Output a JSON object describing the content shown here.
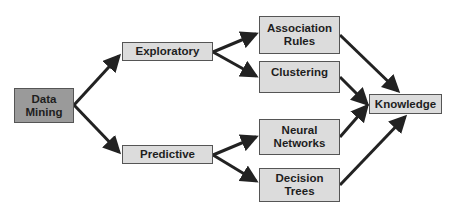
{
  "diagram": {
    "type": "flow",
    "nodes": [
      {
        "id": "data-mining",
        "label": "Data\nMining"
      },
      {
        "id": "exploratory",
        "label": "Exploratory"
      },
      {
        "id": "predictive",
        "label": "Predictive"
      },
      {
        "id": "association-rules",
        "label": "Association\nRules"
      },
      {
        "id": "clustering",
        "label": "Clustering"
      },
      {
        "id": "neural-networks",
        "label": "Neural\nNetworks"
      },
      {
        "id": "decision-trees",
        "label": "Decision\nTrees"
      },
      {
        "id": "knowledge",
        "label": "Knowledge"
      }
    ],
    "edges": [
      {
        "from": "data-mining",
        "to": "exploratory"
      },
      {
        "from": "data-mining",
        "to": "predictive"
      },
      {
        "from": "exploratory",
        "to": "association-rules"
      },
      {
        "from": "exploratory",
        "to": "clustering"
      },
      {
        "from": "predictive",
        "to": "neural-networks"
      },
      {
        "from": "predictive",
        "to": "decision-trees"
      },
      {
        "from": "association-rules",
        "to": "knowledge"
      },
      {
        "from": "clustering",
        "to": "knowledge"
      },
      {
        "from": "neural-networks",
        "to": "knowledge"
      },
      {
        "from": "decision-trees",
        "to": "knowledge"
      }
    ],
    "colors": {
      "root_fill": "#9a9a9a",
      "node_fill": "#dcdcdc",
      "border": "#555555",
      "edge": "#222222",
      "text": "#1e1e1e"
    }
  }
}
